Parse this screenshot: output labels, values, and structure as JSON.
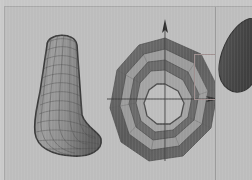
{
  "app": {
    "title": "3D Modeling Viewport",
    "background_color": "#bdbdbd",
    "frame_color": "#c6c6c6",
    "divider_color": "#9b9b9b"
  },
  "layout": {
    "width": 252,
    "height": 180,
    "panels": [
      {
        "name": "main-viewport",
        "x": 5,
        "y": 7,
        "width": 210,
        "height": 173
      },
      {
        "name": "right-viewport",
        "x": 216,
        "y": 7,
        "width": 36,
        "height": 173
      }
    ],
    "divider_x": 215
  },
  "objects": [
    {
      "id": "wire-tube",
      "name": "wireframe-bent-tube",
      "display_mode": "wireframe",
      "shape": "J-shaped tube",
      "outline_color": "#4a4a4a",
      "wire_color": "#5d5d5d",
      "fill_color": "#9a9a9a",
      "x": 20,
      "y": 22,
      "width": 84,
      "height": 130,
      "u_divisions": 14,
      "v_divisions": 22
    },
    {
      "id": "torus",
      "name": "faceted-torus",
      "display_mode": "shaded-faceted",
      "shape": "torus",
      "sides": 10,
      "outer_color": "#636363",
      "mid_color": "#8f8f8f",
      "inner_color": "#a5a5a5",
      "hole_color": "#bdbdbd",
      "x": 100,
      "y": 25,
      "width": 120,
      "height": 135
    },
    {
      "id": "teardrop",
      "name": "dark-teardrop-blob",
      "display_mode": "shaded",
      "shape": "teardrop",
      "fill_color": "#4e4e4e",
      "clipped": "right-edge",
      "x": 216,
      "y": 18,
      "width": 36,
      "height": 95
    }
  ],
  "gizmo": {
    "name": "axis-gizmo",
    "origin": {
      "x": 165,
      "y": 92
    },
    "axis_color": "#3c3c3c",
    "axes": [
      {
        "name": "y-axis-up",
        "direction": "up",
        "arrow": true,
        "length": 82
      },
      {
        "name": "y-axis-down",
        "direction": "down",
        "arrow": false,
        "length": 62
      },
      {
        "name": "x-axis-right",
        "direction": "right",
        "arrow": true,
        "length": 50
      },
      {
        "name": "x-axis-left",
        "direction": "left",
        "arrow": false,
        "length": 62
      }
    ],
    "quadrant_box": {
      "x": 189,
      "y": 47,
      "width": 26,
      "height": 46,
      "color": "#9f8f8f"
    }
  }
}
